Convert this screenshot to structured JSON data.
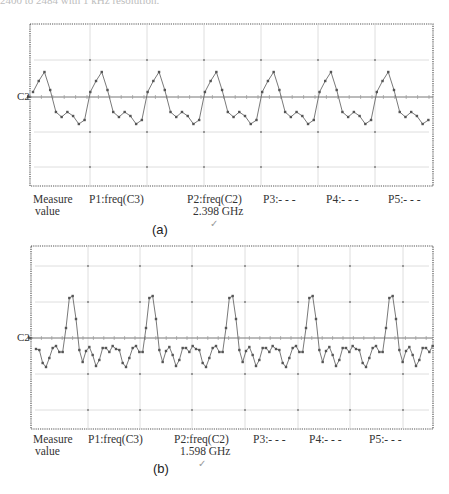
{
  "caption_fragment": "2400 to 2484 with 1 kHz resolution.",
  "panels": [
    {
      "id": "a",
      "label": "(a)",
      "channel_label": "C2",
      "measure_label_line1": "Measure",
      "measure_label_line2": "value",
      "p1": "P1:freq(C3)",
      "p2": "P2:freq(C2)",
      "p2_value": "2.398 GHz",
      "p3": "P3:- - -",
      "p4": "P4:- - -",
      "p5": "P5:- - -",
      "check_mark": "✓"
    },
    {
      "id": "b",
      "label": "(b)",
      "channel_label": "C2",
      "measure_label_line1": "Measure",
      "measure_label_line2": "value",
      "p1": "P1:freq(C3)",
      "p2": "P2:freq(C2)",
      "p2_value": "1.598 GHz",
      "p3": "P3:- - -",
      "p4": "P4:- - -",
      "p5": "P5:- - -",
      "check_mark": "✓"
    }
  ],
  "chart_data": [
    {
      "type": "line",
      "title": "(a) Oscilloscope trace C2",
      "channel": "C2",
      "measurement": {
        "name": "freq(C2)",
        "value": 2.398,
        "unit": "GHz"
      },
      "grid": true,
      "frame": {
        "x": 30,
        "y": 24,
        "w": 403,
        "h": 162
      },
      "baseline_y": 97,
      "vgrid_x": [
        90,
        147,
        204,
        261,
        318,
        375
      ],
      "hgrid_y": [
        60,
        97,
        132,
        167
      ],
      "period_px": 57.3,
      "start_x": 33,
      "cycles": 7.1,
      "shape_offsets_y": [
        -5,
        -16,
        -25,
        -7,
        15,
        20,
        15,
        19,
        27,
        23
      ],
      "points_xy": [
        [
          34,
          92
        ],
        [
          37,
          81
        ],
        [
          42,
          72
        ],
        [
          48,
          90
        ],
        [
          53,
          112
        ],
        [
          60,
          117
        ],
        [
          66,
          112
        ],
        [
          71,
          116
        ],
        [
          77,
          125
        ],
        [
          82,
          121
        ],
        [
          88,
          101
        ],
        [
          93,
          80
        ],
        [
          99,
          73
        ],
        [
          105,
          87
        ],
        [
          111,
          109
        ],
        [
          117,
          118
        ],
        [
          122,
          113
        ],
        [
          128,
          115
        ],
        [
          134,
          124
        ],
        [
          139,
          119
        ]
      ]
    },
    {
      "type": "line",
      "title": "(b) Oscilloscope trace C2",
      "channel": "C2",
      "measurement": {
        "name": "freq(C2)",
        "value": 1.598,
        "unit": "GHz"
      },
      "grid": true,
      "frame": {
        "x": 31,
        "y": 246,
        "w": 402,
        "h": 183
      },
      "baseline_y": 338,
      "vgrid_x": [
        88,
        140,
        192,
        245,
        298,
        350,
        403
      ],
      "hgrid_y": [
        266,
        302,
        338,
        374,
        410
      ],
      "period_px": 80,
      "start_x": 36,
      "cycles": 5.0,
      "shape_offsets_y": [
        11,
        12,
        25,
        29,
        20,
        10,
        8,
        14,
        14,
        -10,
        -40,
        -42,
        -19,
        12,
        24,
        13,
        9,
        17,
        28,
        22,
        10,
        10,
        14,
        8
      ],
      "points_xy": [
        [
          36,
          349
        ],
        [
          41,
          350
        ],
        [
          46,
          363
        ],
        [
          52,
          367
        ],
        [
          57,
          358
        ],
        [
          62,
          348
        ],
        [
          67,
          346
        ],
        [
          72,
          352
        ],
        [
          77,
          352
        ],
        [
          82,
          328
        ],
        [
          88,
          298
        ],
        [
          94,
          296
        ],
        [
          99,
          319
        ],
        [
          105,
          350
        ],
        [
          110,
          362
        ],
        [
          115,
          351
        ],
        [
          121,
          347
        ],
        [
          126,
          355
        ],
        [
          132,
          366
        ],
        [
          137,
          360
        ],
        [
          142,
          348
        ],
        [
          147,
          348
        ],
        [
          152,
          352
        ],
        [
          157,
          346
        ]
      ]
    }
  ]
}
